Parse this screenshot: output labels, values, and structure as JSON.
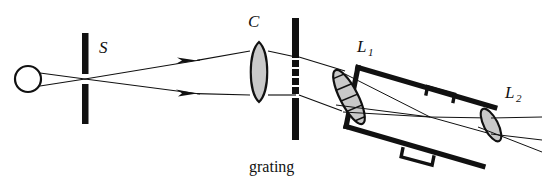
{
  "figure": {
    "kind": "optical-ray-diagram",
    "background_color": "#ffffff",
    "ink_color": "#111111",
    "glass_fill_color": "#c9c9c9",
    "width": 545,
    "height": 183
  },
  "labels": {
    "source": "",
    "slit": "S",
    "collimator": "C",
    "grating": "grating",
    "objective": "L",
    "objective_sub": "1",
    "eyepiece": "L",
    "eyepiece_sub": "2"
  },
  "components": {
    "source": {
      "name": "light-source",
      "shape": "circle",
      "cx": 28,
      "cy": 79,
      "r": 13
    },
    "slit": {
      "name": "slit-S",
      "shape": "vertical-bar-with-gap",
      "x": 85,
      "top": 33,
      "bottom": 124,
      "gap_top": 74,
      "gap_bottom": 84,
      "thickness": 6
    },
    "collimator": {
      "name": "collimator-lens-C",
      "shape": "biconvex-lens",
      "cx": 259,
      "cy": 72,
      "rx": 11,
      "ry": 30
    },
    "grating": {
      "name": "diffraction-grating",
      "shape": "vertical-bar-dashed-center",
      "x": 295,
      "top": 18,
      "bottom": 140,
      "thickness": 7,
      "ruled_top": 58,
      "ruled_bottom": 94,
      "ruled_segments": 4
    },
    "objective": {
      "name": "objective-lens-L1",
      "shape": "hatched-ellipse",
      "cx": 349,
      "cy": 97,
      "rx": 9,
      "ry": 30,
      "rotation_deg": -27,
      "hatch_lines": 6
    },
    "eyepiece": {
      "name": "eyepiece-lens-L2",
      "shape": "ellipse",
      "cx": 491,
      "cy": 125,
      "rx": 7,
      "ry": 18,
      "rotation_deg": -27
    },
    "telescope_tube": {
      "name": "telescope-tube",
      "angle_deg": 27,
      "near_center": [
        352,
        97
      ],
      "far_center": [
        491,
        125
      ],
      "half_width": 30,
      "wall_thickness": 5,
      "brackets": 2
    }
  },
  "rays": {
    "source_to_slit_count": 2,
    "slit_to_collimator_count": 2,
    "arrowheads": 2,
    "collimator_to_grating_count": 2,
    "grating_to_objective_count": 2,
    "inside_tube_converging": 2,
    "exit_rays_count": 3,
    "description": "Diverging rays from the source cross at slit S, diverge to collimator lens C which collimates them onto the grating; the diffracted parallel beam enters objective L1, converges to a focus inside the telescope tube, then diverges through eyepiece L2."
  }
}
